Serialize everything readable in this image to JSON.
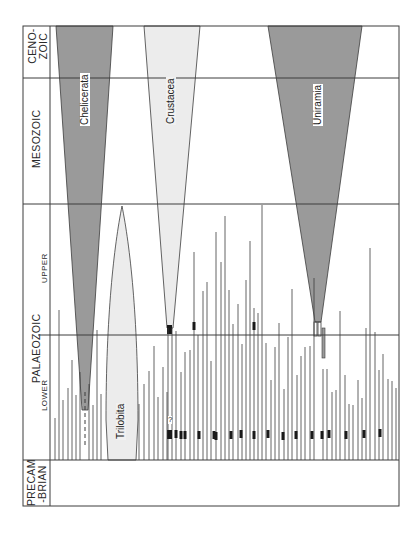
{
  "figure": {
    "type": "phylogenetic spindle diagram (arthropod groups through geological time)",
    "frame": {
      "x": 23,
      "y": 26,
      "width": 376,
      "height": 480
    },
    "colors": {
      "line": "#3c3c3c",
      "dark_fill": "#9a9a9a",
      "light_fill": "#ececec",
      "marker": "#1a1a1a",
      "background": "#ffffff"
    }
  },
  "eras": [
    {
      "id": "cenozoic",
      "label_line1": "CENO-",
      "label_line2": "ZOIC",
      "y_top": 26,
      "y_bottom": 78
    },
    {
      "id": "mesozoic",
      "label": "MESOZOIC",
      "y_top": 78,
      "y_bottom": 204
    },
    {
      "id": "palaeozoic",
      "label": "PALAEOZOIC",
      "y_top": 204,
      "y_bottom": 460,
      "subdivisions": [
        {
          "id": "upper",
          "label": "UPPER",
          "y_top": 204,
          "y_bottom": 335
        },
        {
          "id": "lower",
          "label": "LOWER",
          "y_top": 335,
          "y_bottom": 460
        }
      ]
    },
    {
      "id": "precambrian",
      "label_line1": "PRECAM",
      "label_line2": "-BRIAN",
      "y_top": 460,
      "y_bottom": 506
    }
  ],
  "taxa": [
    {
      "id": "chelicerata",
      "label": "Chelicerata",
      "fill": "dark",
      "top_left": 56,
      "top_right": 113,
      "apex_x": 85,
      "apex_y": 410,
      "dashed_to_y": 448
    },
    {
      "id": "crustacea",
      "label": "Crustacea",
      "fill": "light",
      "top_left": 144,
      "top_right": 200,
      "apex_x": 170,
      "apex_y": 328,
      "stem_to_y": 460,
      "query_mark": "?"
    },
    {
      "id": "uniramia",
      "label": "Uniramia",
      "fill": "dark",
      "top_left": 268,
      "top_right": 362,
      "apex_x": 318,
      "apex_y": 322,
      "stem_to_y": 358
    },
    {
      "id": "trilobita",
      "label": "Trilobita",
      "fill": "light",
      "shape": "lens",
      "center_x": 122,
      "top_y": 206,
      "bottom_y": 460,
      "half_width": 16
    }
  ],
  "extinct_lineages": {
    "description": "thin vertical lines = short-lived extinct arthropod groups rising from the Precambrian boundary",
    "base_y": 460,
    "lines": [
      {
        "x": 55,
        "top": 418
      },
      {
        "x": 59,
        "top": 310
      },
      {
        "x": 63,
        "top": 400
      },
      {
        "x": 68,
        "top": 388
      },
      {
        "x": 72,
        "top": 360
      },
      {
        "x": 76,
        "top": 395
      },
      {
        "x": 80,
        "top": 372
      },
      {
        "x": 89,
        "top": 384
      },
      {
        "x": 93,
        "top": 405
      },
      {
        "x": 97,
        "top": 330
      },
      {
        "x": 101,
        "top": 394
      },
      {
        "x": 139,
        "top": 404
      },
      {
        "x": 144,
        "top": 384
      },
      {
        "x": 149,
        "top": 371
      },
      {
        "x": 154,
        "top": 346
      },
      {
        "x": 158,
        "top": 397
      },
      {
        "x": 163,
        "top": 367
      },
      {
        "x": 167,
        "top": 392
      },
      {
        "x": 176,
        "top": 331
      },
      {
        "x": 181,
        "top": 372
      },
      {
        "x": 185,
        "top": 352
      },
      {
        "x": 190,
        "top": 350
      },
      {
        "x": 194,
        "top": 252
      },
      {
        "x": 198,
        "top": 335
      },
      {
        "x": 203,
        "top": 291
      },
      {
        "x": 207,
        "top": 282
      },
      {
        "x": 211,
        "top": 361
      },
      {
        "x": 216,
        "top": 232
      },
      {
        "x": 221,
        "top": 262
      },
      {
        "x": 225,
        "top": 216
      },
      {
        "x": 229,
        "top": 290
      },
      {
        "x": 233,
        "top": 324
      },
      {
        "x": 238,
        "top": 304
      },
      {
        "x": 242,
        "top": 344
      },
      {
        "x": 246,
        "top": 280
      },
      {
        "x": 250,
        "top": 241
      },
      {
        "x": 254,
        "top": 308
      },
      {
        "x": 258,
        "top": 313
      },
      {
        "x": 262,
        "top": 205
      },
      {
        "x": 266,
        "top": 343
      },
      {
        "x": 271,
        "top": 380
      },
      {
        "x": 275,
        "top": 347
      },
      {
        "x": 279,
        "top": 323
      },
      {
        "x": 284,
        "top": 389
      },
      {
        "x": 288,
        "top": 337
      },
      {
        "x": 292,
        "top": 289
      },
      {
        "x": 297,
        "top": 375
      },
      {
        "x": 301,
        "top": 356
      },
      {
        "x": 305,
        "top": 347
      },
      {
        "x": 310,
        "top": 346
      },
      {
        "x": 314,
        "top": 278
      },
      {
        "x": 323,
        "top": 369
      },
      {
        "x": 327,
        "top": 369
      },
      {
        "x": 332,
        "top": 392
      },
      {
        "x": 336,
        "top": 390
      },
      {
        "x": 340,
        "top": 311
      },
      {
        "x": 345,
        "top": 375
      },
      {
        "x": 349,
        "top": 404
      },
      {
        "x": 353,
        "top": 405
      },
      {
        "x": 358,
        "top": 380
      },
      {
        "x": 362,
        "top": 398
      },
      {
        "x": 366,
        "top": 328
      },
      {
        "x": 370,
        "top": 248
      },
      {
        "x": 375,
        "top": 332
      },
      {
        "x": 379,
        "top": 370
      },
      {
        "x": 383,
        "top": 354
      },
      {
        "x": 388,
        "top": 379
      },
      {
        "x": 392,
        "top": 381
      },
      {
        "x": 396,
        "top": 388
      }
    ],
    "long_lines": [
      {
        "x": 250,
        "top": 26,
        "note": "faint line in Mesozoic"
      },
      {
        "x": 248,
        "top": 118,
        "note": "upper extension"
      }
    ],
    "markers": [
      {
        "x": 176,
        "y": 434
      },
      {
        "x": 181,
        "y": 435
      },
      {
        "x": 185,
        "y": 435
      },
      {
        "x": 199,
        "y": 435
      },
      {
        "x": 214,
        "y": 435
      },
      {
        "x": 216,
        "y": 436
      },
      {
        "x": 231,
        "y": 435
      },
      {
        "x": 241,
        "y": 434
      },
      {
        "x": 254,
        "y": 435
      },
      {
        "x": 268,
        "y": 434
      },
      {
        "x": 283,
        "y": 436
      },
      {
        "x": 296,
        "y": 435
      },
      {
        "x": 312,
        "y": 435
      },
      {
        "x": 322,
        "y": 435
      },
      {
        "x": 329,
        "y": 434
      },
      {
        "x": 346,
        "y": 435
      },
      {
        "x": 364,
        "y": 434
      },
      {
        "x": 380,
        "y": 433
      },
      {
        "x": 194,
        "y": 326
      },
      {
        "x": 254,
        "y": 326
      }
    ]
  }
}
